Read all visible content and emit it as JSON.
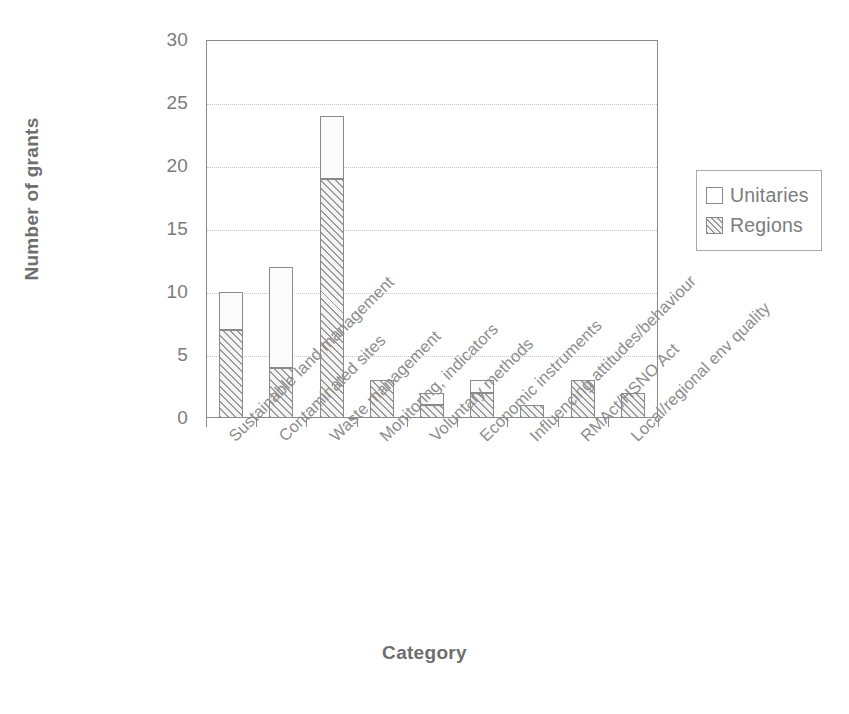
{
  "chart_data": {
    "type": "bar",
    "subtype": "stacked-vertical",
    "title": "",
    "xlabel": "Category",
    "ylabel": "Number of grants",
    "ylim": [
      0,
      30
    ],
    "ytick_step": 5,
    "yticks": [
      0,
      5,
      10,
      15,
      20,
      25,
      30
    ],
    "ytick_labels": [
      "0",
      "5",
      "10",
      "15",
      "20",
      "25",
      "30"
    ],
    "grid": "horizontal-dotted",
    "legend_position": "right",
    "categories": [
      "Sustainable land management",
      "Contaminated sites",
      "Waste management",
      "Monitoring, indicators",
      "Voluntary methods",
      "Economic instruments",
      "Influencing attitudes/behaviour",
      "RMAct/HSNO Act",
      "Local/regional env quality"
    ],
    "series": [
      {
        "name": "Regions",
        "values": [
          7,
          4,
          19,
          3,
          1,
          2,
          1,
          3,
          2
        ]
      },
      {
        "name": "Unitaries",
        "values": [
          3,
          8,
          5,
          0,
          1,
          1,
          0,
          0,
          0
        ]
      }
    ],
    "totals": [
      10,
      12,
      24,
      3,
      2,
      3,
      1,
      3,
      2
    ],
    "colors": {
      "regions_fill": "#f4f4f4",
      "regions_hatch": "#9b9b9b",
      "unitaries_fill": "#fbfbfb",
      "outline": "#8a8a8a",
      "text": "#7c7c7c",
      "gridline": "#c8c8c8"
    }
  },
  "legend": {
    "items": [
      {
        "label": "Unitaries",
        "swatch": "empty-square-icon"
      },
      {
        "label": "Regions",
        "swatch": "hatched-square-icon"
      }
    ]
  }
}
